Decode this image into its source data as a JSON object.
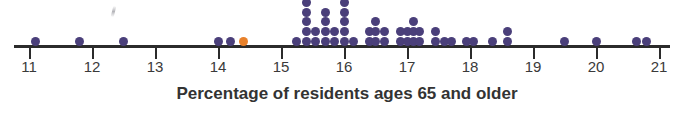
{
  "caption": "Percentage of residents ages 65 and older",
  "chart_data": {
    "type": "scatter",
    "plot_style": "dot-plot",
    "title": "",
    "xlabel": "Percentage of residents ages 65 and older",
    "ylabel": "",
    "xlim": [
      10.7,
      21.3
    ],
    "xticks": [
      11,
      12,
      13,
      14,
      15,
      16,
      17,
      18,
      19,
      20,
      21
    ],
    "xtick_labels": [
      "11",
      "12",
      "13",
      "14",
      "15",
      "16",
      "17",
      "18",
      "19",
      "20",
      "21"
    ],
    "grid": false,
    "legend": "none",
    "dot_color": "#4a3f7a",
    "highlight_color": "#e8812b",
    "axis_color": "#2b2b2b",
    "n_points": 64,
    "stacks": [
      {
        "value": 11.1,
        "count": 1
      },
      {
        "value": 11.8,
        "count": 1
      },
      {
        "value": 12.5,
        "count": 1
      },
      {
        "value": 14.0,
        "count": 1
      },
      {
        "value": 14.2,
        "count": 1
      },
      {
        "value": 14.4,
        "count": 1,
        "highlight": true
      },
      {
        "value": 15.25,
        "count": 1
      },
      {
        "value": 15.4,
        "count": 5
      },
      {
        "value": 15.55,
        "count": 2
      },
      {
        "value": 15.7,
        "count": 4
      },
      {
        "value": 15.85,
        "count": 2
      },
      {
        "value": 16.0,
        "count": 5
      },
      {
        "value": 16.15,
        "count": 1
      },
      {
        "value": 16.4,
        "count": 2
      },
      {
        "value": 16.5,
        "count": 3
      },
      {
        "value": 16.65,
        "count": 2
      },
      {
        "value": 16.9,
        "count": 2
      },
      {
        "value": 17.0,
        "count": 2
      },
      {
        "value": 17.1,
        "count": 3
      },
      {
        "value": 17.2,
        "count": 2
      },
      {
        "value": 17.45,
        "count": 2
      },
      {
        "value": 17.6,
        "count": 1
      },
      {
        "value": 17.7,
        "count": 1
      },
      {
        "value": 17.95,
        "count": 1
      },
      {
        "value": 18.05,
        "count": 1
      },
      {
        "value": 18.35,
        "count": 1
      },
      {
        "value": 18.6,
        "count": 2
      },
      {
        "value": 19.5,
        "count": 1
      },
      {
        "value": 20.0,
        "count": 1
      },
      {
        "value": 20.65,
        "count": 1
      },
      {
        "value": 20.8,
        "count": 1
      }
    ]
  }
}
